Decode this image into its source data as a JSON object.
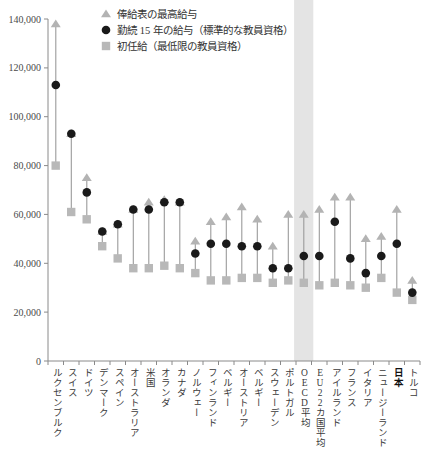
{
  "chart_data": {
    "type": "scatter",
    "title": "",
    "xlabel": "",
    "ylabel": "",
    "ylim": [
      0,
      140000
    ],
    "ytick_values": [
      0,
      20000,
      40000,
      60000,
      80000,
      100000,
      120000,
      140000
    ],
    "ytick_labels": [
      "0",
      "20,000",
      "40,000",
      "60,000",
      "80,000",
      "100,000",
      "120,000",
      "140,000"
    ],
    "grid": false,
    "legend_position": "top-right",
    "highlight_band_categories": [
      "OECD平均"
    ],
    "categories": [
      "ルクセンブルク",
      "スイス",
      "ドイツ",
      "デンマーク",
      "スペイン",
      "オーストラリア",
      "米国",
      "オランダ",
      "カナダ",
      "ノルウェー",
      "フィンランド",
      "ベルギー",
      "オーストリア",
      "ベルギー",
      "スウェーデン",
      "ポルトガル",
      "OECD平均",
      "EU22カ国平均",
      "アイルランド",
      "フランス",
      "イタリア",
      "ニュージーランド",
      "日本",
      "トルコ"
    ],
    "category_bold": [
      false,
      false,
      false,
      false,
      false,
      false,
      false,
      false,
      false,
      false,
      false,
      false,
      false,
      false,
      false,
      false,
      false,
      false,
      false,
      false,
      false,
      false,
      true,
      false
    ],
    "series": [
      {
        "name": "俸給表の最高給与",
        "marker": "triangle",
        "color": "#b3b3b3",
        "values": [
          138000,
          93000,
          75000,
          53000,
          56000,
          62000,
          65000,
          66000,
          65000,
          49000,
          57000,
          59000,
          63000,
          58000,
          47000,
          60000,
          60000,
          62000,
          67000,
          67000,
          50000,
          51000,
          62000,
          33000
        ]
      },
      {
        "name": "勤続 15 年の給与（標準的な教員資格）",
        "marker": "circle",
        "color": "#1a1a1a",
        "values": [
          113000,
          93000,
          69000,
          53000,
          56000,
          62000,
          62000,
          65000,
          65000,
          44000,
          48000,
          48000,
          47000,
          47000,
          38000,
          38000,
          43000,
          43000,
          57000,
          42000,
          36000,
          43000,
          48000,
          28000
        ]
      },
      {
        "name": "初任給（最低限の教員資格）",
        "marker": "square",
        "color": "#b8b8b8",
        "values": [
          80000,
          61000,
          58000,
          47000,
          42000,
          38000,
          38000,
          39000,
          38000,
          36000,
          33000,
          33000,
          34000,
          34000,
          32000,
          33000,
          32000,
          31000,
          32000,
          31000,
          30000,
          34000,
          28000,
          25000
        ]
      }
    ]
  },
  "legend": {
    "items": [
      {
        "label": "俸給表の最高給与",
        "marker": "triangle-icon"
      },
      {
        "label": "勤続 15 年の給与（標準的な教員資格）",
        "marker": "circle-icon"
      },
      {
        "label": "初任給（最低限の教員資格）",
        "marker": "square-icon"
      }
    ]
  }
}
